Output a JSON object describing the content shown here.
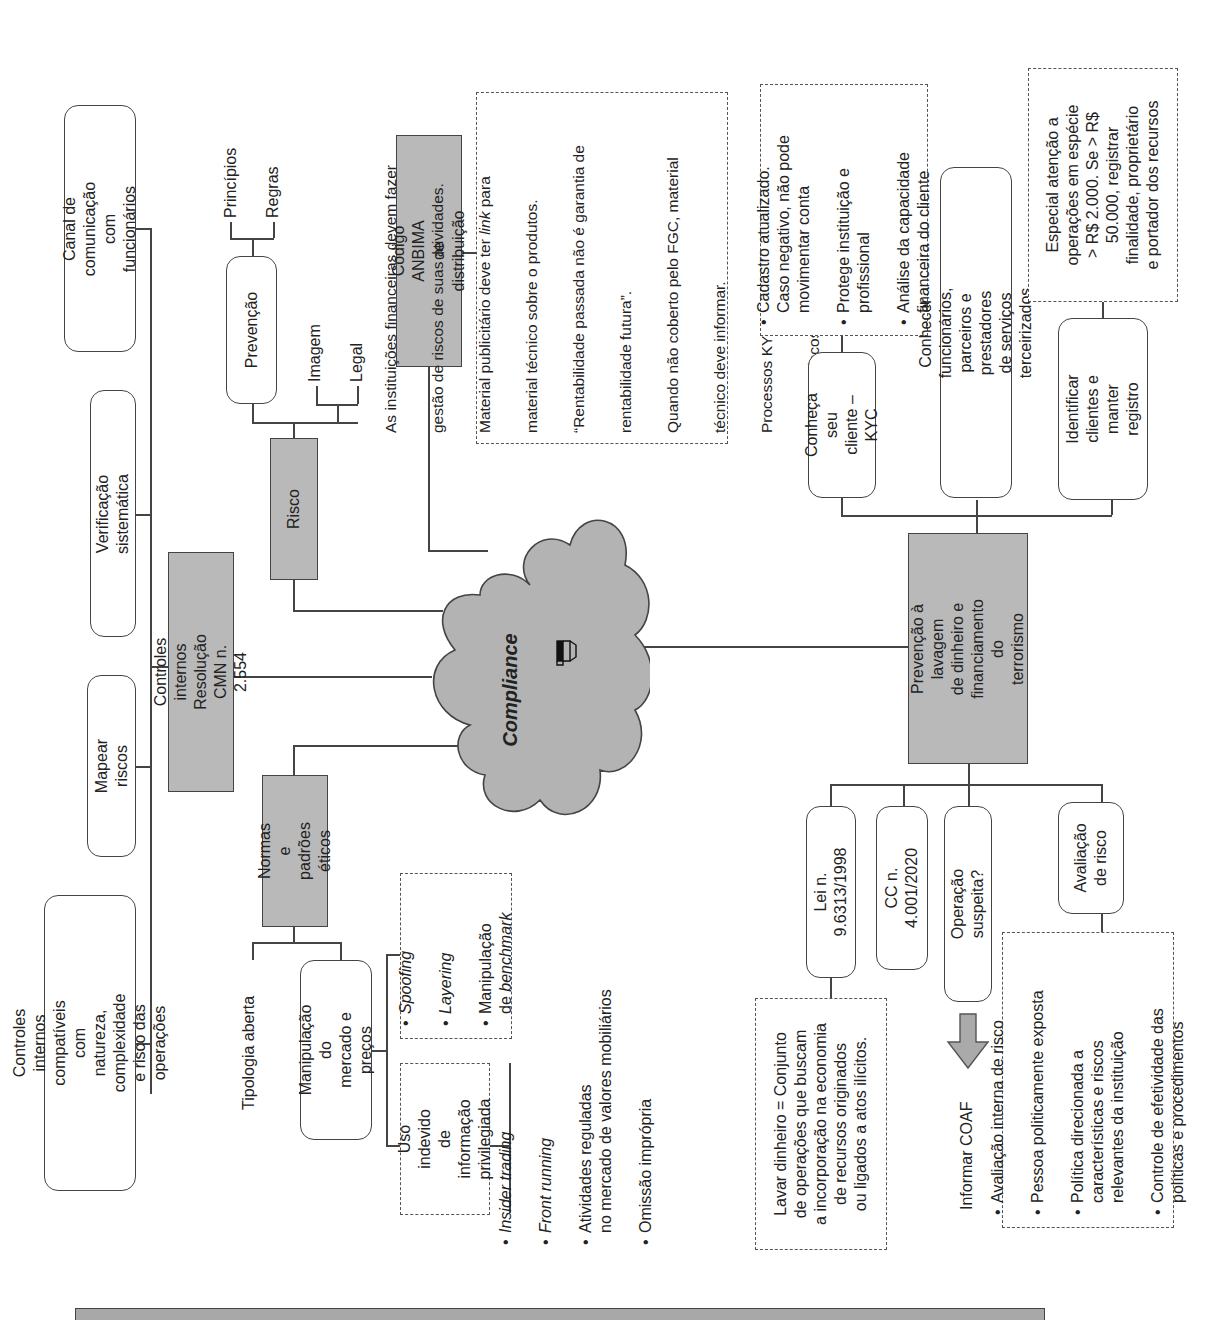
{
  "center": {
    "title": "Compliance",
    "icon": "books-icon"
  },
  "controles": {
    "title": "Controles internos\nResolução CMN n. 2.554",
    "children": [
      "Canal de comunicação\ncom funcionários",
      "Verificação sistemática",
      "Mapear riscos",
      "Controles internos compatíveis\ncom natureza, complexidade\ne risco das operações"
    ]
  },
  "risco": {
    "title": "Risco",
    "prevencao": {
      "label": "Prevenção",
      "children": [
        "Princípios",
        "Regras"
      ]
    },
    "others": [
      "Imagem",
      "Legal"
    ]
  },
  "anbima": {
    "title": "Código ANBIMA\nde distribuição",
    "note_lines": [
      "As instituições financeiras devem fazer",
      "gestão de riscos de suas atividades.",
      "Material publicitário deve ter link para",
      "material técnico sobre o produtos.",
      "“Rentabilidade passada não é garantia de",
      "rentabilidade futura”.",
      "Quando não coberto pelo FGC, material",
      "técnico deve informar.",
      "Processos KYC e Suitability obrigatórios.",
      "Informar riscos para cliente."
    ]
  },
  "normas": {
    "title": "Normas e\npadrões éticos",
    "tipologia": "Tipologia aberta",
    "manipulacao": {
      "label": "Manipulação do\nmercado e preços",
      "examples": [
        "Spoofing",
        "Layering",
        "Manipulação\nde benchmark"
      ]
    },
    "uso_indevido": {
      "label": "Uso indevido de\ninformação\nprivilegiada",
      "examples": [
        "Insider trading",
        "Front running",
        "Atividades reguladas\nno mercado de valores mobiliários",
        "Omissão imprópria"
      ]
    }
  },
  "pld": {
    "title": "Prevenção à lavagem\nde dinheiro e\nfinanciamento do\nterrorismo",
    "upper": {
      "kyc": {
        "label": "Conheça seu\ncliente – KYC",
        "notes": [
          "Cadastro atualizado.\nCaso negativo, não pode\nmovimentar conta",
          "Protege instituição e\nprofissional",
          "Análise da capacidade\nfinanceira do cliente"
        ]
      },
      "conhecer": {
        "label": "Conhecer funcionários, parceiros e\nprestadores de serviços terceirizados"
      },
      "identificar": {
        "label": "Identificar\nclientes e manter\nregistro",
        "note": "Especial atenção a\noperações em espécie\n> R$ 2.000. Se > R$\n50.000, registrar\nfinalidade, proprietário\ne portador dos recursos"
      }
    },
    "lower": {
      "lei": {
        "label": "Lei n. 9.6313/1998",
        "note": "Lavar dinheiro = Conjunto\nde operações que buscam\na incorporação na economia\nde recursos originados\nou ligados a atos ilícitos."
      },
      "cc": {
        "label": "CC n. 4.001/2020"
      },
      "operacao": {
        "label": "Operação suspeita?",
        "arrow_label": "Informar COAF"
      },
      "avaliacao": {
        "label": "Avaliação\nde risco",
        "notes": [
          "Avaliação interna de risco",
          "Pessoa politicamente exposta",
          "Política direcionada a\ncaracterísticas e riscos\nrelevantes da instituição",
          "Controle de efetividade das\npolíticas e procedimentos"
        ]
      }
    }
  },
  "colors": {
    "node_gray": "#b9b9b9",
    "line": "#444444",
    "cloud": "#b3b3b3"
  }
}
